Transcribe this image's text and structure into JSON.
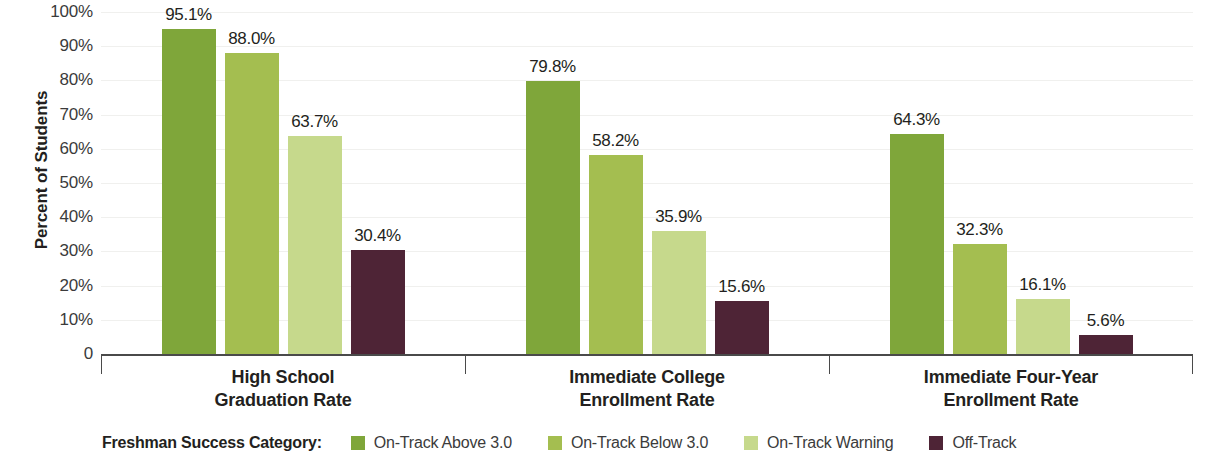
{
  "chart_data": {
    "type": "bar",
    "title": "",
    "xlabel": "",
    "ylabel": "Percent of Students",
    "ylim": [
      0,
      100
    ],
    "grid": true,
    "legend_position": "bottom",
    "legend_title": "Freshman Success Category:",
    "categories": [
      "High School\nGraduation Rate",
      "Immediate College\nEnrollment Rate",
      "Immediate Four-Year\nEnrollment Rate"
    ],
    "category_lines": [
      [
        "High School",
        "Graduation Rate"
      ],
      [
        "Immediate College",
        "Enrollment Rate"
      ],
      [
        "Immediate Four-Year",
        "Enrollment Rate"
      ]
    ],
    "series": [
      {
        "name": "On-Track Above 3.0",
        "color": "#7fa63a",
        "values": [
          95.1,
          79.8,
          64.3
        ],
        "labels": [
          "95.1%",
          "79.8%",
          "64.3%"
        ]
      },
      {
        "name": "On-Track Below 3.0",
        "color": "#a4be50",
        "values": [
          88.0,
          58.2,
          32.3
        ],
        "labels": [
          "88.0%",
          "58.2%",
          "32.3%"
        ]
      },
      {
        "name": "On-Track Warning",
        "color": "#c6d98c",
        "values": [
          63.7,
          35.9,
          16.1
        ],
        "labels": [
          "63.7%",
          "35.9%",
          "16.1%"
        ]
      },
      {
        "name": "Off-Track",
        "color": "#4e2436",
        "values": [
          30.4,
          15.6,
          5.6
        ],
        "labels": [
          "30.4%",
          "15.6%",
          "5.6%"
        ]
      }
    ],
    "y_ticks": [
      {
        "value": 100,
        "label": "100%"
      },
      {
        "value": 90,
        "label": "90%"
      },
      {
        "value": 80,
        "label": "80%"
      },
      {
        "value": 70,
        "label": "70%"
      },
      {
        "value": 60,
        "label": "60%"
      },
      {
        "value": 50,
        "label": "50%"
      },
      {
        "value": 40,
        "label": "40%"
      },
      {
        "value": 30,
        "label": "30%"
      },
      {
        "value": 20,
        "label": "20%"
      },
      {
        "value": 10,
        "label": "10%"
      },
      {
        "value": 0,
        "label": "0"
      }
    ]
  }
}
